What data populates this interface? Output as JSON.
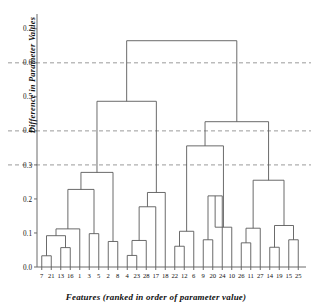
{
  "figure": {
    "background": "#ffffff",
    "line_color": "#5a5a5a",
    "grid_color": "#9a9a9a",
    "axis_color": "#6b6b6b"
  },
  "chart_data": {
    "type": "dendrogram",
    "title": "",
    "xlabel": "Features (ranked in order of parameter value)",
    "ylabel": "Difference in Parameter Values",
    "ylim": [
      0.0,
      0.72
    ],
    "yticks": [
      0.0,
      0.1,
      0.2,
      0.3,
      0.4,
      0.5,
      0.6,
      0.7
    ],
    "ytick_labels": [
      "0.0",
      "0.1",
      "0.2",
      "0.3",
      "0.4",
      "0.5",
      "0.6",
      "0.7"
    ],
    "grid": true,
    "gridlines_dashed_at": [
      0.3,
      0.4,
      0.6
    ],
    "legend": null,
    "leaf_order": [
      7,
      21,
      13,
      16,
      1,
      3,
      5,
      2,
      8,
      4,
      23,
      28,
      17,
      18,
      22,
      12,
      6,
      9,
      20,
      24,
      10,
      26,
      11,
      27,
      14,
      19,
      15,
      25
    ],
    "leaf_labels": [
      "7",
      "21",
      "13",
      "16",
      "1",
      "3",
      "5",
      "2",
      "8",
      "4",
      "23",
      "28",
      "17",
      "18",
      "22",
      "12",
      "6",
      "9",
      "20",
      "24",
      "10",
      "26",
      "11",
      "27",
      "14",
      "19",
      "15",
      "25"
    ],
    "n_leaves": 28,
    "merges": [
      {
        "id": "m1",
        "left": "leaf:7",
        "right": "leaf:21",
        "height": 0.033
      },
      {
        "id": "m2",
        "left": "leaf:13",
        "right": "leaf:16",
        "height": 0.057
      },
      {
        "id": "m3",
        "left": "m1",
        "right": "m2",
        "height": 0.092
      },
      {
        "id": "m4",
        "left": "m3",
        "right": "leaf:1",
        "height": 0.112
      },
      {
        "id": "m5",
        "left": "leaf:3",
        "right": "leaf:5",
        "height": 0.098
      },
      {
        "id": "m6",
        "left": "m4",
        "right": "m5",
        "height": 0.228
      },
      {
        "id": "m7",
        "left": "leaf:2",
        "right": "leaf:8",
        "height": 0.075
      },
      {
        "id": "m8",
        "left": "m6",
        "right": "m7",
        "height": 0.278
      },
      {
        "id": "m9",
        "left": "leaf:4",
        "right": "leaf:23",
        "height": 0.034
      },
      {
        "id": "m10",
        "left": "m9",
        "right": "leaf:28",
        "height": 0.078
      },
      {
        "id": "m11",
        "left": "m10",
        "right": "leaf:17",
        "height": 0.177
      },
      {
        "id": "m12",
        "left": "m11",
        "right": "leaf:18",
        "height": 0.219
      },
      {
        "id": "m13",
        "left": "m8",
        "right": "m12",
        "height": 0.487
      },
      {
        "id": "m14",
        "left": "leaf:22",
        "right": "leaf:12",
        "height": 0.061
      },
      {
        "id": "m15",
        "left": "m14",
        "right": "leaf:6",
        "height": 0.105
      },
      {
        "id": "m16",
        "left": "leaf:9",
        "right": "leaf:20",
        "height": 0.08
      },
      {
        "id": "m17",
        "left": "m16",
        "right": "leaf:24",
        "height": 0.209
      },
      {
        "id": "m18",
        "left": "m17",
        "right": "leaf:10",
        "height": 0.117
      },
      {
        "id": "m19",
        "left": "m15",
        "right": "m18",
        "height": 0.356
      },
      {
        "id": "m20",
        "left": "leaf:26",
        "right": "leaf:11",
        "height": 0.071
      },
      {
        "id": "m21",
        "left": "m20",
        "right": "leaf:27",
        "height": 0.114
      },
      {
        "id": "m22",
        "left": "leaf:14",
        "right": "leaf:19",
        "height": 0.058
      },
      {
        "id": "m23",
        "left": "leaf:15",
        "right": "leaf:25",
        "height": 0.08
      },
      {
        "id": "m24",
        "left": "m23",
        "right": "m22",
        "height": 0.122
      },
      {
        "id": "m25",
        "left": "m21",
        "right": "m24",
        "height": 0.255
      },
      {
        "id": "m26",
        "left": "m19",
        "right": "m25",
        "height": 0.427
      },
      {
        "id": "m27",
        "left": "m13",
        "right": "m26",
        "height": 0.665
      }
    ],
    "root": "m27"
  }
}
